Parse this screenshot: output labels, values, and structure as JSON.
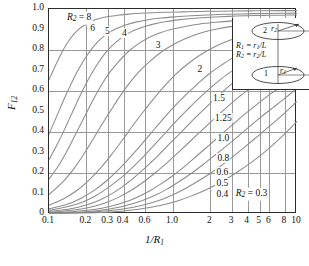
{
  "chart_data": {
    "type": "line",
    "title": "",
    "xlabel": "1/R1",
    "ylabel": "F12",
    "xscale": "log",
    "xlim": [
      0.1,
      10
    ],
    "ylim": [
      0,
      1.0
    ],
    "grid": true,
    "legend_position": "inline-curve-labels",
    "x_tick_labels": [
      "0.1",
      "0.2",
      "0.3",
      "0.4",
      "0.6",
      "1.0",
      "2",
      "3",
      "4",
      "5",
      "6",
      "8",
      "10"
    ],
    "x_tick_values": [
      0.1,
      0.2,
      0.3,
      0.4,
      0.6,
      1.0,
      2,
      3,
      4,
      5,
      6,
      8,
      10
    ],
    "y_tick_labels": [
      "0",
      "0.1",
      "0.2",
      "0.3",
      "0.4",
      "0.5",
      "0.6",
      "0.7",
      "0.8",
      "0.9",
      "1.0"
    ],
    "y_tick_values": [
      0,
      0.1,
      0.2,
      0.3,
      0.4,
      0.5,
      0.6,
      0.7,
      0.8,
      0.9,
      1.0
    ],
    "y_gridlines": [
      0.2,
      0.4,
      0.6,
      0.8
    ],
    "series_parameter": "R2",
    "curve_color": "#8c8c8c",
    "frame_color": "#2b2b2b",
    "grid_color": "#9a9a9a",
    "series": [
      {
        "name": "8",
        "label": "R2 = 8",
        "label_x": 0.175,
        "label_y": 0.955,
        "x": [
          0.1,
          0.115,
          0.13,
          0.145,
          0.16,
          0.18,
          0.2,
          0.23,
          0.26,
          0.3,
          0.36,
          0.44,
          0.55,
          0.7,
          0.9,
          1.2,
          1.6,
          2.2,
          3.0,
          4.5,
          7.0,
          10.0
        ],
        "y": [
          0.655,
          0.735,
          0.8,
          0.846,
          0.88,
          0.909,
          0.927,
          0.945,
          0.955,
          0.963,
          0.97,
          0.975,
          0.979,
          0.982,
          0.984,
          0.986,
          0.988,
          0.989,
          0.99,
          0.991,
          0.992,
          0.992
        ]
      },
      {
        "name": "6",
        "label": "6",
        "label_x": 0.225,
        "label_y": 0.905,
        "x": [
          0.1,
          0.115,
          0.13,
          0.15,
          0.17,
          0.19,
          0.22,
          0.25,
          0.29,
          0.34,
          0.41,
          0.5,
          0.63,
          0.8,
          1.05,
          1.4,
          1.9,
          2.6,
          3.6,
          5.2,
          7.5,
          10.0
        ],
        "y": [
          0.39,
          0.475,
          0.55,
          0.632,
          0.697,
          0.748,
          0.804,
          0.843,
          0.876,
          0.901,
          0.921,
          0.936,
          0.948,
          0.956,
          0.962,
          0.967,
          0.971,
          0.974,
          0.976,
          0.978,
          0.979,
          0.98
        ]
      },
      {
        "name": "5",
        "label": "5",
        "label_x": 0.295,
        "label_y": 0.895,
        "x": [
          0.1,
          0.12,
          0.14,
          0.16,
          0.18,
          0.21,
          0.24,
          0.28,
          0.32,
          0.38,
          0.45,
          0.55,
          0.68,
          0.86,
          1.1,
          1.5,
          2.0,
          2.8,
          3.8,
          5.4,
          7.6,
          10.0
        ],
        "y": [
          0.265,
          0.355,
          0.44,
          0.517,
          0.583,
          0.662,
          0.722,
          0.78,
          0.819,
          0.858,
          0.886,
          0.908,
          0.925,
          0.938,
          0.947,
          0.955,
          0.96,
          0.964,
          0.967,
          0.969,
          0.97,
          0.971
        ]
      },
      {
        "name": "4",
        "label": "4",
        "label_x": 0.405,
        "label_y": 0.885,
        "x": [
          0.1,
          0.12,
          0.14,
          0.17,
          0.2,
          0.23,
          0.27,
          0.31,
          0.36,
          0.43,
          0.52,
          0.63,
          0.78,
          0.98,
          1.25,
          1.65,
          2.2,
          3.0,
          4.1,
          5.7,
          7.8,
          10.0
        ],
        "y": [
          0.17,
          0.238,
          0.308,
          0.408,
          0.492,
          0.563,
          0.638,
          0.692,
          0.74,
          0.789,
          0.829,
          0.859,
          0.883,
          0.901,
          0.915,
          0.927,
          0.935,
          0.942,
          0.947,
          0.95,
          0.952,
          0.953
        ]
      },
      {
        "name": "3",
        "label": "3",
        "label_x": 0.76,
        "label_y": 0.825,
        "x": [
          0.1,
          0.13,
          0.16,
          0.19,
          0.23,
          0.27,
          0.32,
          0.38,
          0.45,
          0.54,
          0.65,
          0.8,
          1.0,
          1.28,
          1.65,
          2.2,
          2.9,
          3.9,
          5.3,
          7.0,
          8.6,
          10.0
        ],
        "y": [
          0.095,
          0.158,
          0.224,
          0.29,
          0.371,
          0.441,
          0.512,
          0.581,
          0.642,
          0.698,
          0.744,
          0.789,
          0.826,
          0.857,
          0.882,
          0.901,
          0.914,
          0.923,
          0.929,
          0.932,
          0.934,
          0.935
        ]
      },
      {
        "name": "2",
        "label": "2",
        "label_x": 1.65,
        "label_y": 0.705,
        "x": [
          0.1,
          0.13,
          0.17,
          0.21,
          0.26,
          0.32,
          0.39,
          0.47,
          0.57,
          0.7,
          0.86,
          1.06,
          1.32,
          1.68,
          2.15,
          2.8,
          3.7,
          4.9,
          6.4,
          8.0,
          9.0,
          10.0
        ],
        "y": [
          0.043,
          0.073,
          0.117,
          0.165,
          0.224,
          0.291,
          0.36,
          0.428,
          0.495,
          0.563,
          0.626,
          0.683,
          0.733,
          0.778,
          0.815,
          0.845,
          0.868,
          0.885,
          0.896,
          0.902,
          0.904,
          0.906
        ]
      },
      {
        "name": "1.5",
        "label": "1.5",
        "label_x": 2.35,
        "label_y": 0.568,
        "x": [
          0.1,
          0.14,
          0.18,
          0.23,
          0.29,
          0.36,
          0.44,
          0.54,
          0.66,
          0.82,
          1.0,
          1.25,
          1.55,
          1.95,
          2.5,
          3.2,
          4.1,
          5.3,
          6.8,
          8.2,
          9.2,
          10.0
        ],
        "y": [
          0.025,
          0.047,
          0.076,
          0.114,
          0.161,
          0.214,
          0.27,
          0.33,
          0.392,
          0.459,
          0.518,
          0.578,
          0.63,
          0.683,
          0.729,
          0.77,
          0.803,
          0.829,
          0.848,
          0.858,
          0.863,
          0.867
        ]
      },
      {
        "name": "1.25",
        "label": "1.25",
        "label_x": 2.55,
        "label_y": 0.468,
        "x": [
          0.1,
          0.14,
          0.19,
          0.24,
          0.3,
          0.38,
          0.47,
          0.58,
          0.71,
          0.88,
          1.08,
          1.35,
          1.7,
          2.15,
          2.7,
          3.5,
          4.5,
          5.8,
          7.2,
          8.5,
          9.3,
          10.0
        ],
        "y": [
          0.018,
          0.035,
          0.06,
          0.09,
          0.129,
          0.176,
          0.226,
          0.281,
          0.338,
          0.4,
          0.458,
          0.518,
          0.576,
          0.631,
          0.679,
          0.724,
          0.761,
          0.791,
          0.813,
          0.827,
          0.833,
          0.838
        ]
      },
      {
        "name": "1.0",
        "label": "1.0",
        "label_x": 2.55,
        "label_y": 0.372,
        "x": [
          0.1,
          0.15,
          0.2,
          0.26,
          0.33,
          0.41,
          0.51,
          0.63,
          0.78,
          0.96,
          1.2,
          1.5,
          1.9,
          2.4,
          3.0,
          3.8,
          4.8,
          6.1,
          7.5,
          8.7,
          9.4,
          10.0
        ],
        "y": [
          0.012,
          0.026,
          0.044,
          0.07,
          0.103,
          0.142,
          0.188,
          0.238,
          0.292,
          0.349,
          0.407,
          0.468,
          0.528,
          0.585,
          0.637,
          0.685,
          0.726,
          0.76,
          0.785,
          0.801,
          0.808,
          0.813
        ]
      },
      {
        "name": "0.8",
        "label": "0.8",
        "label_x": 2.55,
        "label_y": 0.272,
        "x": [
          0.1,
          0.15,
          0.21,
          0.28,
          0.36,
          0.45,
          0.56,
          0.7,
          0.87,
          1.08,
          1.35,
          1.7,
          2.15,
          2.7,
          3.4,
          4.3,
          5.4,
          6.7,
          8.0,
          9.0,
          9.6,
          10.0
        ],
        "y": [
          0.008,
          0.018,
          0.032,
          0.053,
          0.08,
          0.112,
          0.15,
          0.195,
          0.243,
          0.295,
          0.35,
          0.407,
          0.464,
          0.519,
          0.571,
          0.618,
          0.66,
          0.694,
          0.721,
          0.738,
          0.747,
          0.752
        ]
      },
      {
        "name": "0.6",
        "label": "0.6",
        "label_x": 2.5,
        "label_y": 0.205,
        "x": [
          0.1,
          0.16,
          0.23,
          0.31,
          0.4,
          0.51,
          0.64,
          0.8,
          1.0,
          1.25,
          1.55,
          1.95,
          2.45,
          3.1,
          3.9,
          4.9,
          6.0,
          7.3,
          8.4,
          9.2,
          9.7,
          10.0
        ],
        "y": [
          0.005,
          0.012,
          0.022,
          0.037,
          0.056,
          0.081,
          0.111,
          0.147,
          0.188,
          0.234,
          0.283,
          0.335,
          0.388,
          0.441,
          0.493,
          0.541,
          0.582,
          0.617,
          0.644,
          0.661,
          0.671,
          0.677
        ]
      },
      {
        "name": "0.5",
        "label": "0.5",
        "label_x": 2.5,
        "label_y": 0.15,
        "x": [
          0.1,
          0.17,
          0.25,
          0.34,
          0.44,
          0.56,
          0.71,
          0.89,
          1.1,
          1.38,
          1.72,
          2.15,
          2.7,
          3.4,
          4.2,
          5.2,
          6.4,
          7.6,
          8.7,
          9.4,
          9.8,
          10.0
        ],
        "y": [
          0.004,
          0.009,
          0.017,
          0.029,
          0.045,
          0.065,
          0.09,
          0.12,
          0.155,
          0.195,
          0.238,
          0.284,
          0.332,
          0.382,
          0.43,
          0.476,
          0.519,
          0.554,
          0.583,
          0.6,
          0.609,
          0.614
        ]
      },
      {
        "name": "0.4",
        "label": "0.4",
        "label_x": 2.5,
        "label_y": 0.098,
        "x": [
          0.1,
          0.18,
          0.27,
          0.37,
          0.49,
          0.63,
          0.8,
          1.0,
          1.25,
          1.56,
          1.95,
          2.45,
          3.05,
          3.8,
          4.7,
          5.8,
          7.0,
          8.1,
          9.0,
          9.5,
          9.8,
          10.0
        ],
        "y": [
          0.003,
          0.007,
          0.013,
          0.022,
          0.034,
          0.05,
          0.07,
          0.094,
          0.123,
          0.157,
          0.194,
          0.236,
          0.28,
          0.327,
          0.374,
          0.421,
          0.463,
          0.497,
          0.523,
          0.537,
          0.545,
          0.549
        ]
      },
      {
        "name": "0.3",
        "label": "R2 = 0.3",
        "label_x": 4.3,
        "label_y": 0.098,
        "x": [
          0.1,
          0.19,
          0.29,
          0.4,
          0.53,
          0.68,
          0.87,
          1.1,
          1.38,
          1.72,
          2.15,
          2.7,
          3.35,
          4.2,
          5.2,
          6.3,
          7.5,
          8.5,
          9.2,
          9.6,
          9.9,
          10.0
        ],
        "y": [
          0.002,
          0.005,
          0.009,
          0.015,
          0.023,
          0.034,
          0.048,
          0.065,
          0.086,
          0.11,
          0.138,
          0.171,
          0.207,
          0.248,
          0.291,
          0.334,
          0.376,
          0.408,
          0.429,
          0.441,
          0.449,
          0.452
        ]
      }
    ]
  },
  "axes": {
    "x_label_main": "1/R",
    "x_label_sub": "1",
    "y_label_main": "F",
    "y_label_sub": "12"
  },
  "inset": {
    "eq1_lhs": "R",
    "eq1_lhs_sub": "1",
    "eq1_rhs": " = r",
    "eq1_rhs_sub": "1",
    "eq1_tail": "/L",
    "eq2_lhs": "R",
    "eq2_lhs_sub": "2",
    "eq2_rhs": " = r",
    "eq2_rhs_sub": "2",
    "eq2_tail": "/L",
    "disk_top_label": "2",
    "disk_bottom_label": "1",
    "radius_top_label": "r",
    "radius_top_sub": "2",
    "radius_bottom_label": "r",
    "radius_bottom_sub": "1",
    "distance_label": "L"
  }
}
